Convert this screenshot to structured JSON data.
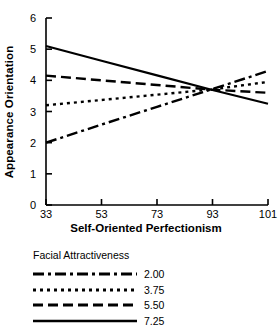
{
  "chart_data": {
    "type": "line",
    "title": "",
    "xlabel": "Self-Oriented Perfectionism",
    "ylabel": "Appearance Orientation",
    "categories": [
      "33",
      "53",
      "73",
      "93",
      "101"
    ],
    "x_tick_labels": [
      "33",
      "53",
      "73",
      "93",
      "101"
    ],
    "y_tick_labels": [
      "0",
      "1",
      "2",
      "3",
      "4",
      "5",
      "6"
    ],
    "ylim": [
      0,
      6
    ],
    "grid": false,
    "legend_position": "below",
    "legend_title": "Facial Attractiveness",
    "series": [
      {
        "name": "2.00",
        "label": "2.00",
        "style": "dash-dot",
        "dasharray": "11,4,3,4",
        "values": [
          2.0,
          2.58,
          3.15,
          3.72,
          4.3
        ]
      },
      {
        "name": "3.75",
        "label": "3.75",
        "style": "dotted",
        "dasharray": "3,4",
        "values": [
          3.2,
          3.37,
          3.54,
          3.71,
          3.95
        ]
      },
      {
        "name": "5.50",
        "label": "5.50",
        "style": "dashed",
        "dasharray": "10,5",
        "values": [
          4.15,
          4.0,
          3.85,
          3.7,
          3.6
        ]
      },
      {
        "name": "7.25",
        "label": "7.25",
        "style": "solid",
        "dasharray": "none",
        "values": [
          5.1,
          4.63,
          4.16,
          3.69,
          3.25
        ]
      }
    ]
  },
  "colors": {
    "axis": "#000000",
    "line": "#000000",
    "background": "#ffffff"
  }
}
